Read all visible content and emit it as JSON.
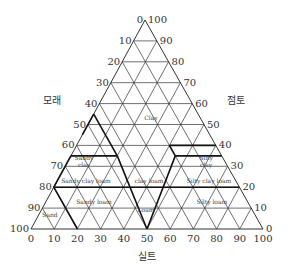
{
  "diagram": {
    "type": "soil-texture-triangle",
    "axes": {
      "left": {
        "title": "모래",
        "ticks": [
          "0",
          "10",
          "20",
          "30",
          "40",
          "50",
          "60",
          "70",
          "80",
          "90",
          "100"
        ]
      },
      "right": {
        "title": "점토",
        "ticks": [
          "100",
          "90",
          "80",
          "70",
          "60",
          "50",
          "40",
          "30",
          "20",
          "10",
          "0"
        ]
      },
      "bottom": {
        "title": "실트",
        "ticks": [
          "0",
          "10",
          "20",
          "30",
          "40",
          "50",
          "60",
          "70",
          "80",
          "90",
          "100"
        ]
      }
    },
    "regions": [
      {
        "id": "clay",
        "label": "Clay"
      },
      {
        "id": "sandy-clay",
        "label_line1": "Sandy",
        "label_line2": "clay"
      },
      {
        "id": "silty-clay",
        "label_line1": "Silty",
        "label_line2": "clay"
      },
      {
        "id": "sandy-clay-loam",
        "label": "Sandy clay loam"
      },
      {
        "id": "clay-loam",
        "label": "clay loam"
      },
      {
        "id": "silty-clay-loam",
        "label": "Silty clay loam"
      },
      {
        "id": "sandy-loam",
        "label": "Sandy loam"
      },
      {
        "id": "loam",
        "label": "Loam"
      },
      {
        "id": "silty-loam",
        "label": "Silty loam"
      },
      {
        "id": "sand",
        "label": "Sand"
      }
    ],
    "colors": {
      "line": "#333333",
      "bold": "#111111",
      "text": "#333333"
    }
  }
}
